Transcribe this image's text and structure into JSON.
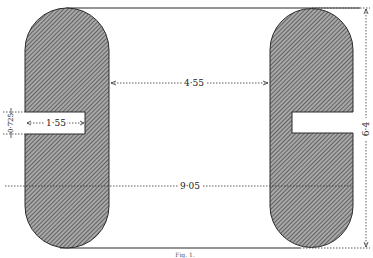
{
  "figure": {
    "caption": "Fig. 1.",
    "dimensions": {
      "inner_gap": "4·55",
      "outer_span": "9·05",
      "height": "6·4",
      "slot_depth": "1·55",
      "slot_width": "0·725"
    },
    "colors": {
      "ink": "#2a2a2a",
      "hatch_bg": "#9a9a9a"
    }
  }
}
